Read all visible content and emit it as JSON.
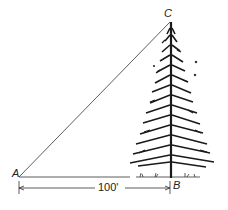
{
  "diagram": {
    "type": "right-triangle-tree-height",
    "points": {
      "A": {
        "label": "A"
      },
      "B": {
        "label": "B"
      },
      "C": {
        "label": "C"
      }
    },
    "dimension": {
      "label": "100'"
    },
    "colors": {
      "ink": "#222222",
      "background": "#ffffff"
    }
  }
}
